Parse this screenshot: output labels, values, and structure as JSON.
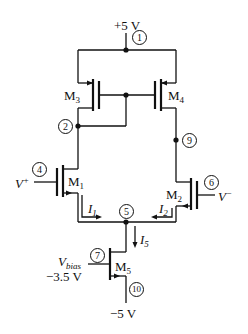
{
  "diagram": {
    "type": "CMOS differential amplifier with current-mirror load",
    "supply_top": "+5 V",
    "supply_bottom": "−5 V",
    "nodes": [
      "1",
      "2",
      "4",
      "5",
      "6",
      "7",
      "9",
      "10"
    ],
    "transistors": {
      "m1": {
        "name": "M",
        "sub": "1"
      },
      "m2": {
        "name": "M",
        "sub": "2"
      },
      "m3": {
        "name": "M",
        "sub": "3"
      },
      "m4": {
        "name": "M",
        "sub": "4"
      },
      "m5": {
        "name": "M",
        "sub": "5"
      }
    },
    "inputs": {
      "vplus": {
        "name": "V",
        "sup": "+"
      },
      "vminus": {
        "name": "V",
        "sup": "−"
      }
    },
    "bias": {
      "name": "V",
      "sub": "bias",
      "value": "−3.5 V"
    },
    "currents": {
      "i1": {
        "name": "I",
        "sub": "1"
      },
      "i2": {
        "name": "I",
        "sub": "2"
      },
      "i5": {
        "name": "I",
        "sub": "5"
      }
    },
    "colors": {
      "line": "#111111",
      "background": "#ffffff"
    }
  }
}
